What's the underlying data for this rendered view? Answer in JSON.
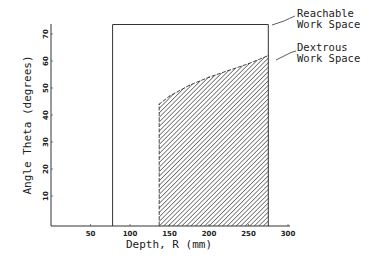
{
  "chart_data": {
    "type": "area",
    "title": "",
    "xlabel": "Depth, R (mm)",
    "ylabel": "Angle Theta (degrees)",
    "xlim": [
      0,
      300
    ],
    "ylim": [
      0,
      75
    ],
    "xticks": [
      50,
      100,
      150,
      200,
      250,
      300
    ],
    "yticks": [
      10,
      20,
      30,
      40,
      50,
      60,
      70
    ],
    "grid": false,
    "series": [
      {
        "name": "Reachable Work Space",
        "style": "outline",
        "x": [
          78,
          78,
          275,
          275
        ],
        "y": [
          0,
          73.5,
          73.5,
          0
        ]
      },
      {
        "name": "Dextrous Work Space",
        "style": "hatched",
        "x": [
          137,
          150,
          175,
          200,
          225,
          250,
          275
        ],
        "y": [
          44,
          47,
          51,
          54,
          56.5,
          59,
          62
        ]
      }
    ],
    "annotations": [
      {
        "text": [
          "Reachable",
          "Work Space"
        ],
        "points_to": "Reachable Work Space",
        "position": "right"
      },
      {
        "text": [
          "Dextrous",
          "Work Space"
        ],
        "points_to": "Dextrous Work Space",
        "position": "right"
      }
    ]
  }
}
